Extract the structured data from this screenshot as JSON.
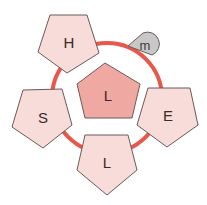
{
  "diagram": {
    "type": "cyclic-pentagon-network",
    "colors": {
      "ring": "#e8574a",
      "outer_fill": "#f7dcd9",
      "center_fill": "#f0a8a2",
      "stroke": "#6b5a58",
      "marker_fill": "#c8c8c8"
    },
    "center": {
      "label": "L"
    },
    "nodes": [
      {
        "id": "top-left",
        "label": "H"
      },
      {
        "id": "left",
        "label": "S"
      },
      {
        "id": "bottom",
        "label": "L"
      },
      {
        "id": "right",
        "label": "E"
      }
    ],
    "marker": {
      "label": "m"
    }
  }
}
